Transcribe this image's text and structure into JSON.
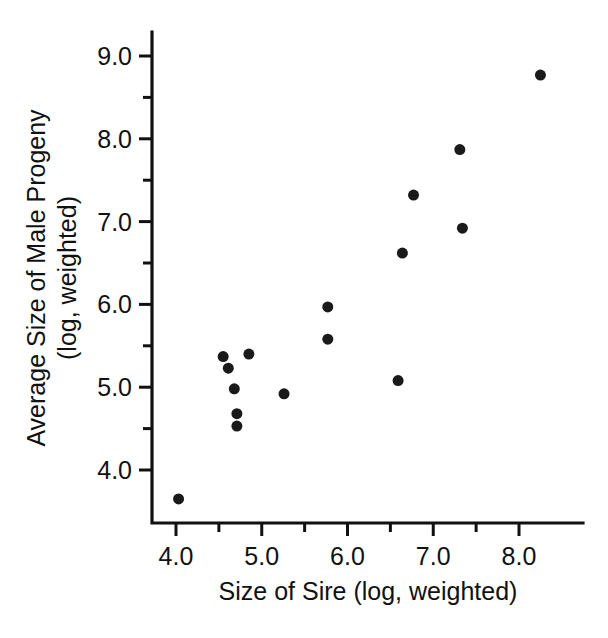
{
  "chart_data": {
    "type": "scatter",
    "title": "",
    "xlabel": "Size of Sire (log, weighted)",
    "ylabel": "Average Size of Male Progeny (log, weighted)",
    "ylabel_lines": [
      "Average Size of Male Progeny",
      "(log, weighted)"
    ],
    "xlim": [
      3.72,
      8.74
    ],
    "ylim": [
      3.43,
      9.23
    ],
    "grid": false,
    "legend": null,
    "x_major_ticks": [
      4.0,
      5.0,
      6.0,
      7.0,
      8.0
    ],
    "x_major_tick_labels": [
      "4.0",
      "5.0",
      "6.0",
      "7.0",
      "8.0"
    ],
    "x_minor_ticks": [
      4.5,
      5.5,
      6.5,
      7.5
    ],
    "y_major_ticks": [
      4.0,
      5.0,
      6.0,
      7.0,
      8.0,
      9.0
    ],
    "y_major_tick_labels": [
      "4.0",
      "5.0",
      "6.0",
      "7.0",
      "8.0",
      "9.0"
    ],
    "y_minor_ticks": [
      4.5,
      5.5,
      6.5,
      7.5,
      8.5
    ],
    "marker": "filled-circle",
    "marker_color": "#1a1a1a",
    "marker_size_px": 11,
    "n_points": 16,
    "x": [
      4.03,
      4.55,
      4.61,
      4.68,
      4.71,
      4.71,
      4.85,
      5.26,
      5.77,
      5.77,
      6.59,
      6.64,
      6.77,
      7.31,
      7.34,
      8.25
    ],
    "y": [
      3.65,
      5.37,
      5.23,
      4.98,
      4.68,
      4.53,
      5.4,
      4.92,
      5.97,
      5.58,
      5.08,
      6.62,
      7.32,
      7.87,
      6.92,
      8.77
    ],
    "points": [
      {
        "x": 4.03,
        "y": 3.65
      },
      {
        "x": 4.55,
        "y": 5.37
      },
      {
        "x": 4.61,
        "y": 5.23
      },
      {
        "x": 4.68,
        "y": 4.98
      },
      {
        "x": 4.71,
        "y": 4.68
      },
      {
        "x": 4.71,
        "y": 4.53
      },
      {
        "x": 4.85,
        "y": 5.4
      },
      {
        "x": 5.26,
        "y": 4.92
      },
      {
        "x": 5.77,
        "y": 5.97
      },
      {
        "x": 5.77,
        "y": 5.58
      },
      {
        "x": 6.59,
        "y": 5.08
      },
      {
        "x": 6.64,
        "y": 6.62
      },
      {
        "x": 6.77,
        "y": 7.32
      },
      {
        "x": 7.31,
        "y": 7.87
      },
      {
        "x": 7.34,
        "y": 6.92
      },
      {
        "x": 8.25,
        "y": 8.77
      }
    ]
  },
  "figure": {
    "background_color": "#ffffff",
    "axis_color": "#111111",
    "text_color": "#111111"
  }
}
